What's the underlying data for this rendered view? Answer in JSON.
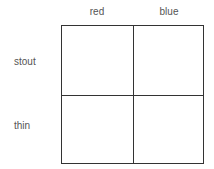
{
  "columns": [
    "red",
    "blue"
  ],
  "rows": [
    "stout",
    "thin"
  ],
  "cells": [
    [
      "",
      ""
    ],
    [
      "",
      ""
    ]
  ]
}
